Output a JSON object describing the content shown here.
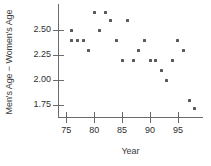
{
  "chart_data": {
    "type": "scatter",
    "title": "",
    "xlabel": "Year",
    "ylabel": "Men's Age − Women's Age",
    "xlim": [
      73.5,
      99.5
    ],
    "ylim": [
      1.63,
      2.76
    ],
    "xticks": [
      75,
      80,
      85,
      90,
      95
    ],
    "xtick_labels": [
      "75",
      "80",
      "85",
      "90",
      "95"
    ],
    "yticks": [
      2.5,
      2.25,
      2.0,
      1.75
    ],
    "ytick_labels": [
      "2.50",
      "2.25",
      "2.00",
      "1.75"
    ],
    "grid": false,
    "legend": null,
    "marker_color": "#595959",
    "axis_color": "#6b6b6b",
    "x": [
      76,
      76,
      77,
      78,
      79,
      80,
      81,
      82,
      83,
      84,
      85,
      86,
      87,
      88,
      89,
      90,
      91,
      92,
      93,
      94,
      95,
      96,
      97,
      98
    ],
    "y": [
      2.5,
      2.4,
      2.4,
      2.4,
      2.3,
      2.68,
      2.5,
      2.68,
      2.6,
      2.4,
      2.2,
      2.6,
      2.2,
      2.3,
      2.4,
      2.2,
      2.2,
      2.1,
      2.0,
      2.2,
      2.4,
      2.3,
      1.8,
      1.72
    ],
    "points": [
      {
        "x": 76,
        "y": 2.5
      },
      {
        "x": 76,
        "y": 2.4
      },
      {
        "x": 77,
        "y": 2.4
      },
      {
        "x": 78,
        "y": 2.4
      },
      {
        "x": 79,
        "y": 2.3
      },
      {
        "x": 80,
        "y": 2.68
      },
      {
        "x": 81,
        "y": 2.5
      },
      {
        "x": 82,
        "y": 2.68
      },
      {
        "x": 83,
        "y": 2.6
      },
      {
        "x": 84,
        "y": 2.4
      },
      {
        "x": 85,
        "y": 2.2
      },
      {
        "x": 86,
        "y": 2.6
      },
      {
        "x": 87,
        "y": 2.2
      },
      {
        "x": 88,
        "y": 2.3
      },
      {
        "x": 89,
        "y": 2.4
      },
      {
        "x": 90,
        "y": 2.2
      },
      {
        "x": 91,
        "y": 2.2
      },
      {
        "x": 92,
        "y": 2.1
      },
      {
        "x": 93,
        "y": 2.0
      },
      {
        "x": 94,
        "y": 2.2
      },
      {
        "x": 95,
        "y": 2.4
      },
      {
        "x": 96,
        "y": 2.3
      },
      {
        "x": 97,
        "y": 1.8
      },
      {
        "x": 98,
        "y": 1.72
      }
    ]
  }
}
